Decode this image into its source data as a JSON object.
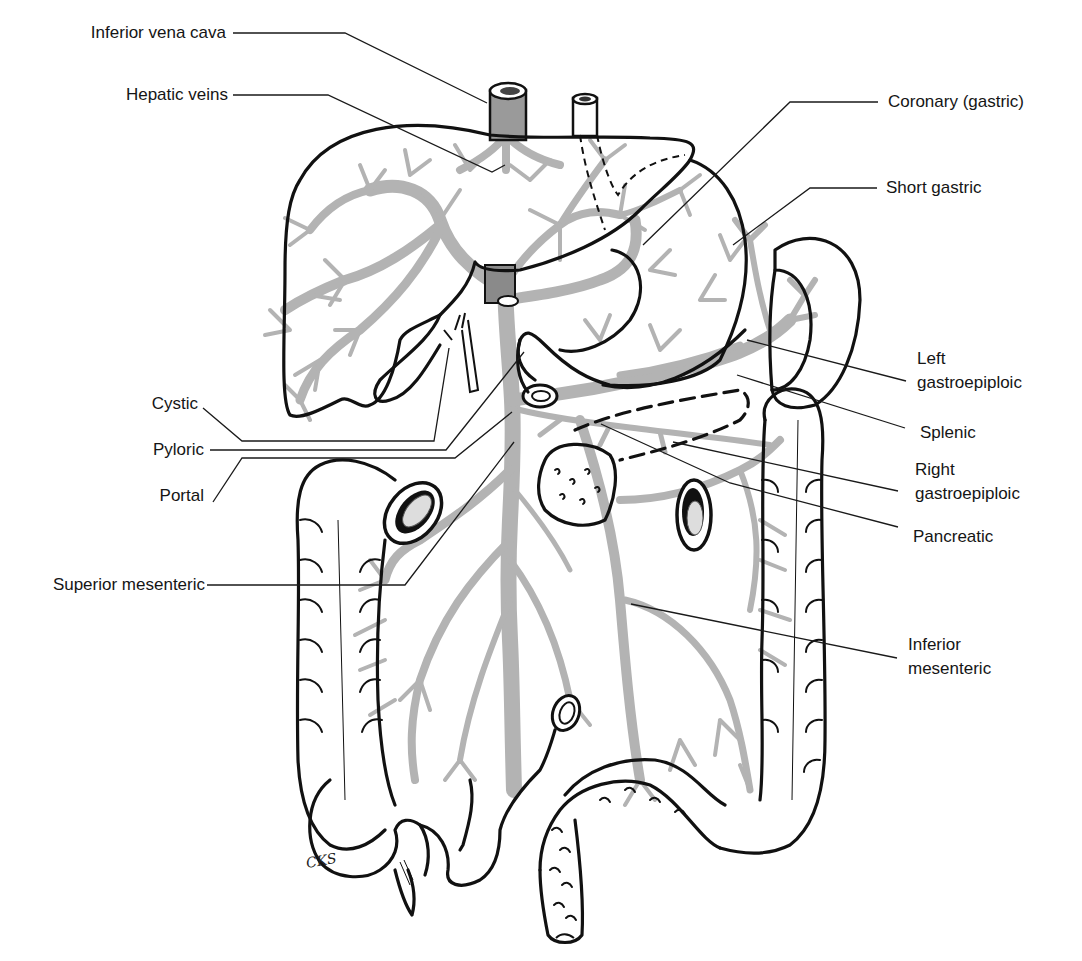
{
  "figure": {
    "signature": "CKS",
    "colors": {
      "outline": "#111111",
      "veins": "#b3b3b3",
      "ivc_fill": "#9a9a9a",
      "background": "#ffffff",
      "text": "#151515"
    }
  },
  "labels": {
    "left": [
      {
        "id": "inferior-vena-cava",
        "text": "Inferior vena cava"
      },
      {
        "id": "hepatic-veins",
        "text": "Hepatic veins"
      },
      {
        "id": "cystic",
        "text": "Cystic"
      },
      {
        "id": "pyloric",
        "text": "Pyloric"
      },
      {
        "id": "portal",
        "text": "Portal"
      },
      {
        "id": "superior-mesenteric",
        "text": "Superior mesenteric"
      }
    ],
    "right": [
      {
        "id": "coronary-gastric",
        "text": "Coronary (gastric)"
      },
      {
        "id": "short-gastric",
        "text": "Short gastric"
      },
      {
        "id": "left-gastroepiploic",
        "line1": "Left",
        "line2": "gastroepiploic"
      },
      {
        "id": "splenic",
        "text": "Splenic"
      },
      {
        "id": "right-gastroepiploic",
        "line1": "Right",
        "line2": "gastroepiploic"
      },
      {
        "id": "pancreatic",
        "text": "Pancreatic"
      },
      {
        "id": "inferior-mesenteric",
        "line1": "Inferior",
        "line2": "mesenteric"
      }
    ]
  }
}
